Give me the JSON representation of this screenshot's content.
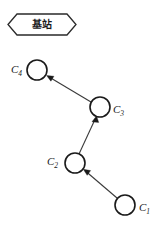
{
  "figure": {
    "type": "node-chain-diagram",
    "background_color": "#ffffff",
    "stroke_color": "#1a1a1a",
    "width": 154,
    "height": 227
  },
  "base_station": {
    "label": "基站",
    "shape": "hexagon",
    "x": 8,
    "y": 14,
    "width": 68,
    "height": 21
  },
  "nodes": [
    {
      "id": "C1",
      "label_main": "C",
      "label_sub": "1",
      "cx": 125,
      "cy": 205,
      "r": 10,
      "label_x": 139,
      "label_y": 211,
      "label_side": "right"
    },
    {
      "id": "C2",
      "label_main": "C",
      "label_sub": "2",
      "cx": 75,
      "cy": 163,
      "r": 10,
      "label_x": 47,
      "label_y": 165,
      "label_side": "left"
    },
    {
      "id": "C3",
      "label_main": "C",
      "label_sub": "3",
      "cx": 100,
      "cy": 107,
      "r": 10,
      "label_x": 113,
      "label_y": 113,
      "label_side": "right"
    },
    {
      "id": "C4",
      "label_main": "C",
      "label_sub": "4",
      "cx": 37,
      "cy": 70,
      "r": 10,
      "label_x": 11,
      "label_y": 70,
      "label_side": "left"
    }
  ],
  "edges": [
    {
      "id": "edge-c1-c2",
      "from": "C1",
      "to": "C2",
      "x1": 117,
      "y1": 198,
      "x2": 84,
      "y2": 170,
      "direction": "up-left"
    },
    {
      "id": "edge-c2-c3",
      "from": "C2",
      "to": "C3",
      "x1": 79,
      "y1": 154,
      "x2": 96,
      "y2": 117,
      "direction": "up-right"
    },
    {
      "id": "edge-c3-c4",
      "from": "C3",
      "to": "C4",
      "x1": 91,
      "y1": 102,
      "x2": 47,
      "y2": 76,
      "direction": "up-left"
    }
  ]
}
